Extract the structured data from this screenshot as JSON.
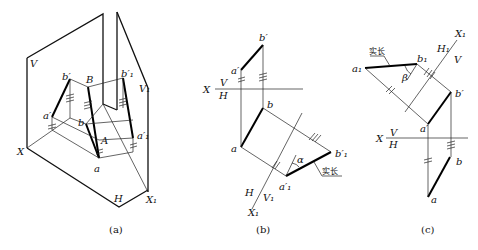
{
  "figure": {
    "panels": [
      {
        "caption": "(a)",
        "labels": {
          "V": "V",
          "V1": "V₁",
          "H": "H",
          "X": "X",
          "X1": "X₁",
          "B": "B",
          "A": "A",
          "b_prime": "b′",
          "b1_prime": "b′₁",
          "a_prime": "a′",
          "a1_prime": "a′₁",
          "a": "a",
          "b": "b"
        }
      },
      {
        "caption": "(b)",
        "labels": {
          "b_prime": "b′",
          "a_prime": "a′",
          "X": "X",
          "V": "V",
          "H": "H",
          "b": "b",
          "a": "a",
          "b1_prime": "b′₁",
          "a1_prime": "a′₁",
          "alpha": "α",
          "true_length": "实长",
          "H_axis": "H",
          "V1": "V₁",
          "X1": "X₁"
        }
      },
      {
        "caption": "(c)",
        "labels": {
          "true_length": "实长",
          "X1": "X₁",
          "H1": "H₁",
          "V": "V",
          "a1": "a₁",
          "b1": "b₁",
          "beta": "β",
          "b_prime": "b′",
          "a_prime": "a′",
          "X": "X",
          "V_axis": "V",
          "H_axis": "H",
          "b": "b",
          "a": "a"
        }
      }
    ]
  }
}
